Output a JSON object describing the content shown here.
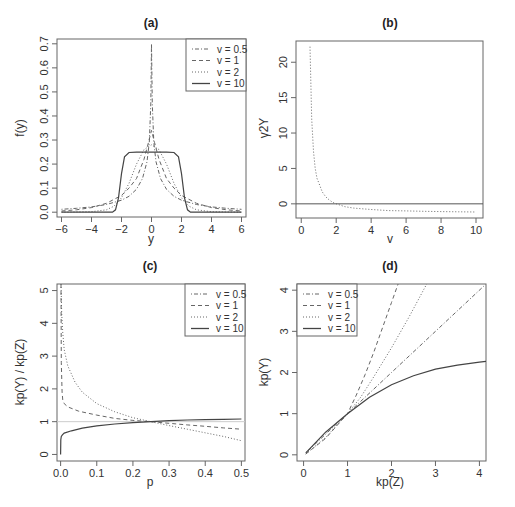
{
  "chart_data": [
    {
      "id": "a",
      "type": "line",
      "title": "(a)",
      "xlabel": "y",
      "ylabel": "f(y)",
      "xlim": [
        -6.3,
        6.3
      ],
      "ylim": [
        -0.02,
        0.72
      ],
      "xticks": [
        -6,
        -4,
        -2,
        0,
        2,
        4,
        6
      ],
      "yticks": [
        0.0,
        0.1,
        0.2,
        0.3,
        0.4,
        0.5,
        0.6,
        0.7
      ],
      "ytick_labels": [
        "0.0",
        "0.1",
        "0.2",
        "0.3",
        "0.4",
        "0.5",
        "0.6",
        "0.7"
      ],
      "legend": {
        "position": "topright",
        "entries": [
          "v = 0.5",
          "v = 1",
          "v = 2",
          "v = 10"
        ]
      },
      "series": [
        {
          "name": "v = 0.5",
          "style": "dotdash",
          "x": [
            -6,
            -5,
            -4,
            -3,
            -2,
            -1.5,
            -1,
            -0.6,
            -0.3,
            -0.15,
            -0.05,
            0,
            0.05,
            0.15,
            0.3,
            0.6,
            1,
            1.5,
            2,
            3,
            4,
            5,
            6
          ],
          "y": [
            0.012,
            0.016,
            0.022,
            0.032,
            0.05,
            0.066,
            0.095,
            0.14,
            0.21,
            0.29,
            0.45,
            0.7,
            0.45,
            0.29,
            0.21,
            0.14,
            0.095,
            0.066,
            0.05,
            0.032,
            0.022,
            0.016,
            0.012
          ]
        },
        {
          "name": "v = 1",
          "style": "dashed",
          "x": [
            -6,
            -5,
            -4,
            -3,
            -2,
            -1.5,
            -1,
            -0.5,
            -0.2,
            0,
            0.2,
            0.5,
            1,
            1.5,
            2,
            3,
            4,
            5,
            6
          ],
          "y": [
            0.005,
            0.01,
            0.019,
            0.037,
            0.07,
            0.1,
            0.14,
            0.22,
            0.29,
            0.34,
            0.29,
            0.22,
            0.14,
            0.1,
            0.07,
            0.037,
            0.019,
            0.01,
            0.005
          ]
        },
        {
          "name": "v = 2",
          "style": "dotted",
          "x": [
            -6,
            -4,
            -3,
            -2.5,
            -2,
            -1.5,
            -1,
            -0.5,
            0,
            0.5,
            1,
            1.5,
            2,
            2.5,
            3,
            4,
            6
          ],
          "y": [
            0.0,
            0.002,
            0.01,
            0.025,
            0.06,
            0.12,
            0.2,
            0.26,
            0.28,
            0.26,
            0.2,
            0.12,
            0.06,
            0.025,
            0.01,
            0.002,
            0.0
          ]
        },
        {
          "name": "v = 10",
          "style": "solid",
          "x": [
            -6,
            -2.6,
            -2.4,
            -2.2,
            -2.0,
            -1.8,
            -1.5,
            -1.0,
            0,
            1.0,
            1.5,
            1.8,
            2.0,
            2.2,
            2.4,
            2.6,
            6
          ],
          "y": [
            0,
            0,
            0.01,
            0.06,
            0.16,
            0.23,
            0.248,
            0.25,
            0.25,
            0.25,
            0.248,
            0.23,
            0.16,
            0.06,
            0.01,
            0,
            0
          ]
        }
      ]
    },
    {
      "id": "b",
      "type": "line",
      "title": "(b)",
      "xlabel": "v",
      "ylabel": "γ2Y",
      "xlim": [
        -0.3,
        10.4
      ],
      "ylim": [
        -2,
        23
      ],
      "xticks": [
        0,
        2,
        4,
        6,
        8,
        10
      ],
      "yticks": [
        0,
        5,
        10,
        15,
        20
      ],
      "hline": 0,
      "series": [
        {
          "name": "gamma2",
          "style": "dotted",
          "x": [
            0.5,
            0.6,
            0.7,
            0.8,
            0.9,
            1.0,
            1.2,
            1.4,
            1.6,
            1.8,
            2.0,
            2.5,
            3,
            4,
            5,
            6,
            7,
            8,
            9,
            10
          ],
          "y": [
            22.2,
            12.0,
            7.4,
            5.0,
            3.6,
            3.0,
            1.7,
            1.0,
            0.55,
            0.2,
            0,
            -0.4,
            -0.6,
            -0.8,
            -0.95,
            -1.0,
            -1.05,
            -1.1,
            -1.12,
            -1.15
          ]
        }
      ]
    },
    {
      "id": "c",
      "type": "line",
      "title": "(c)",
      "xlabel": "p",
      "ylabel": "kp(Y) / kp(Z)",
      "xlim": [
        -0.01,
        0.51
      ],
      "ylim": [
        -0.2,
        5.2
      ],
      "xticks": [
        0.0,
        0.1,
        0.2,
        0.3,
        0.4,
        0.5
      ],
      "xtick_labels": [
        "0.0",
        "0.1",
        "0.2",
        "0.3",
        "0.4",
        "0.5"
      ],
      "yticks": [
        0,
        1,
        2,
        3,
        4,
        5
      ],
      "hline": 1,
      "legend": {
        "position": "topright",
        "entries": [
          "v = 0.5",
          "v = 1",
          "v = 2",
          "v = 10"
        ]
      },
      "series": [
        {
          "name": "v = 2",
          "style": "dotted",
          "x": [
            0.001,
            0.003,
            0.006,
            0.01,
            0.02,
            0.04,
            0.06,
            0.1,
            0.15,
            0.2,
            0.25,
            0.3,
            0.35,
            0.4,
            0.45,
            0.5
          ],
          "y": [
            5.2,
            4.3,
            3.7,
            3.2,
            2.7,
            2.2,
            1.9,
            1.55,
            1.3,
            1.12,
            1.0,
            0.88,
            0.77,
            0.66,
            0.55,
            0.42
          ]
        },
        {
          "name": "v = 1",
          "style": "dashed",
          "x": [
            0.001,
            0.002,
            0.004,
            0.006,
            0.01,
            0.02,
            0.05,
            0.1,
            0.15,
            0.2,
            0.25,
            0.3,
            0.35,
            0.4,
            0.45,
            0.5
          ],
          "y": [
            5.2,
            2.8,
            1.9,
            1.65,
            1.55,
            1.45,
            1.32,
            1.2,
            1.1,
            1.04,
            1.0,
            0.95,
            0.9,
            0.86,
            0.81,
            0.77
          ]
        },
        {
          "name": "v = 10",
          "style": "solid",
          "x": [
            0.0,
            0.0005,
            0.002,
            0.005,
            0.01,
            0.03,
            0.06,
            0.1,
            0.15,
            0.2,
            0.25,
            0.3,
            0.35,
            0.4,
            0.45,
            0.5
          ],
          "y": [
            0.0,
            0.45,
            0.55,
            0.6,
            0.65,
            0.72,
            0.8,
            0.87,
            0.93,
            0.97,
            1.0,
            1.03,
            1.05,
            1.06,
            1.07,
            1.08
          ]
        }
      ]
    },
    {
      "id": "d",
      "type": "line",
      "title": "(d)",
      "xlabel": "kp(Z)",
      "ylabel": "kp(Y)",
      "xlim": [
        -0.15,
        4.15
      ],
      "ylim": [
        -0.15,
        4.15
      ],
      "xticks": [
        0,
        1,
        2,
        3,
        4
      ],
      "yticks": [
        0,
        1,
        2,
        3,
        4
      ],
      "legend": {
        "position": "topleft",
        "entries": [
          "v = 0.5",
          "v = 1",
          "v = 2",
          "v = 10"
        ]
      },
      "series": [
        {
          "name": "v = 0.5",
          "style": "dotdash",
          "x": [
            0.05,
            1,
            2,
            3,
            4.1
          ],
          "y": [
            0.05,
            1,
            2,
            3,
            4.1
          ]
        },
        {
          "name": "v = 1",
          "style": "dashed",
          "x": [
            0.05,
            0.5,
            1.0,
            1.2,
            1.4,
            1.6,
            1.8,
            2.0,
            2.15
          ],
          "y": [
            0.02,
            0.4,
            1.0,
            1.45,
            1.95,
            2.5,
            3.1,
            3.7,
            4.15
          ]
        },
        {
          "name": "v = 2",
          "style": "dotted",
          "x": [
            0.05,
            0.5,
            1.0,
            1.3,
            1.6,
            2.0,
            2.4,
            2.8
          ],
          "y": [
            0.02,
            0.42,
            1.0,
            1.4,
            1.9,
            2.6,
            3.35,
            4.15
          ]
        },
        {
          "name": "v = 10",
          "style": "solid",
          "x": [
            0.05,
            0.5,
            1.0,
            1.5,
            2.0,
            2.5,
            3.0,
            3.5,
            4.0,
            4.15
          ],
          "y": [
            0.05,
            0.55,
            1.0,
            1.4,
            1.7,
            1.92,
            2.08,
            2.18,
            2.25,
            2.27
          ]
        }
      ]
    }
  ]
}
